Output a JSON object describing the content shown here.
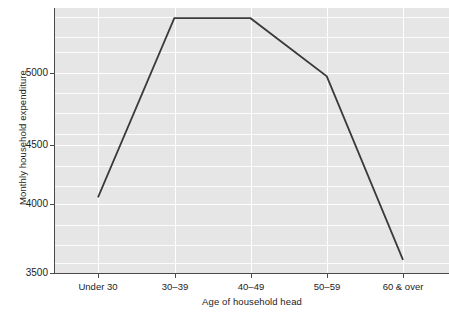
{
  "chart_data": {
    "type": "line",
    "title": "",
    "subtitle": "",
    "xlabel": "Age of household head",
    "ylabel": "Monthly household expenditure",
    "categories": [
      "Under 30",
      "30–39",
      "40–49",
      "50–59",
      "60 & over"
    ],
    "values": [
      4020,
      5250,
      5250,
      4850,
      3590
    ],
    "series": [
      {
        "name": "Monthly household expenditure",
        "values": [
          4020,
          5250,
          5250,
          4850,
          3590
        ]
      }
    ],
    "ylim": [
      3500,
      5320
    ],
    "yticks": [
      3500,
      4000,
      4500,
      5000
    ],
    "ytick_labels": [
      "3500",
      "4000",
      "4500",
      "5000"
    ],
    "y_minor_step": 100,
    "grid": true,
    "grid_color": "#ffffff",
    "plot_background": "#e6e6e6",
    "line_color": "#3a3a3a",
    "legend": "none",
    "legend_position": "none",
    "annotations": []
  },
  "axes": {
    "y_title": "Monthly household expenditure",
    "x_title": "Age of household head"
  },
  "icons": {
    "line_series": "line-series-glyph"
  }
}
